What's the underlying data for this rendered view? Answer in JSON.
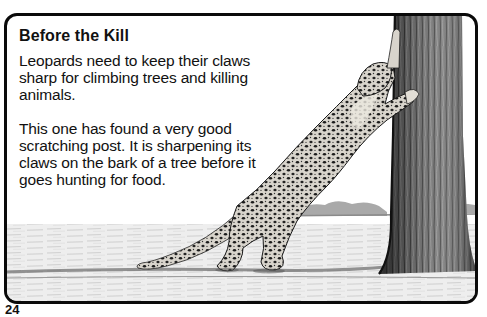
{
  "article": {
    "title": "Before the Kill",
    "paragraphs": [
      "Leopards need to keep their claws sharp for climbing trees and killing animals.",
      "This one has found a very good scratching post. It is sharpening its claws on the bark of a tree before it goes hunting for food."
    ]
  },
  "illustration": {
    "subject": "leopard-scratching-tree",
    "style": "black-and-white pencil drawing"
  },
  "page_number": "24",
  "colors": {
    "frame": "#0a0a0a",
    "text": "#111111",
    "background": "#ffffff"
  }
}
